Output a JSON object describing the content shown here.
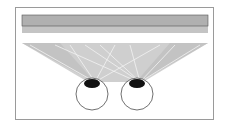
{
  "diagram": {
    "strip_cells": [
      "左",
      "右",
      "左",
      "右",
      "左",
      "右",
      "左",
      "右",
      "左",
      "右",
      "左",
      "右"
    ],
    "lens_label": "レンチキュラレンズ",
    "eyes": [
      {
        "name": "left-eye"
      },
      {
        "name": "right-eye"
      }
    ],
    "colors": {
      "cell_fill": "#b0b0b0",
      "lens_fill": "#a8a8a8",
      "ray_fill": "#c8c8c8",
      "pupil": "#111111",
      "frame": "#9a9a9a"
    }
  }
}
